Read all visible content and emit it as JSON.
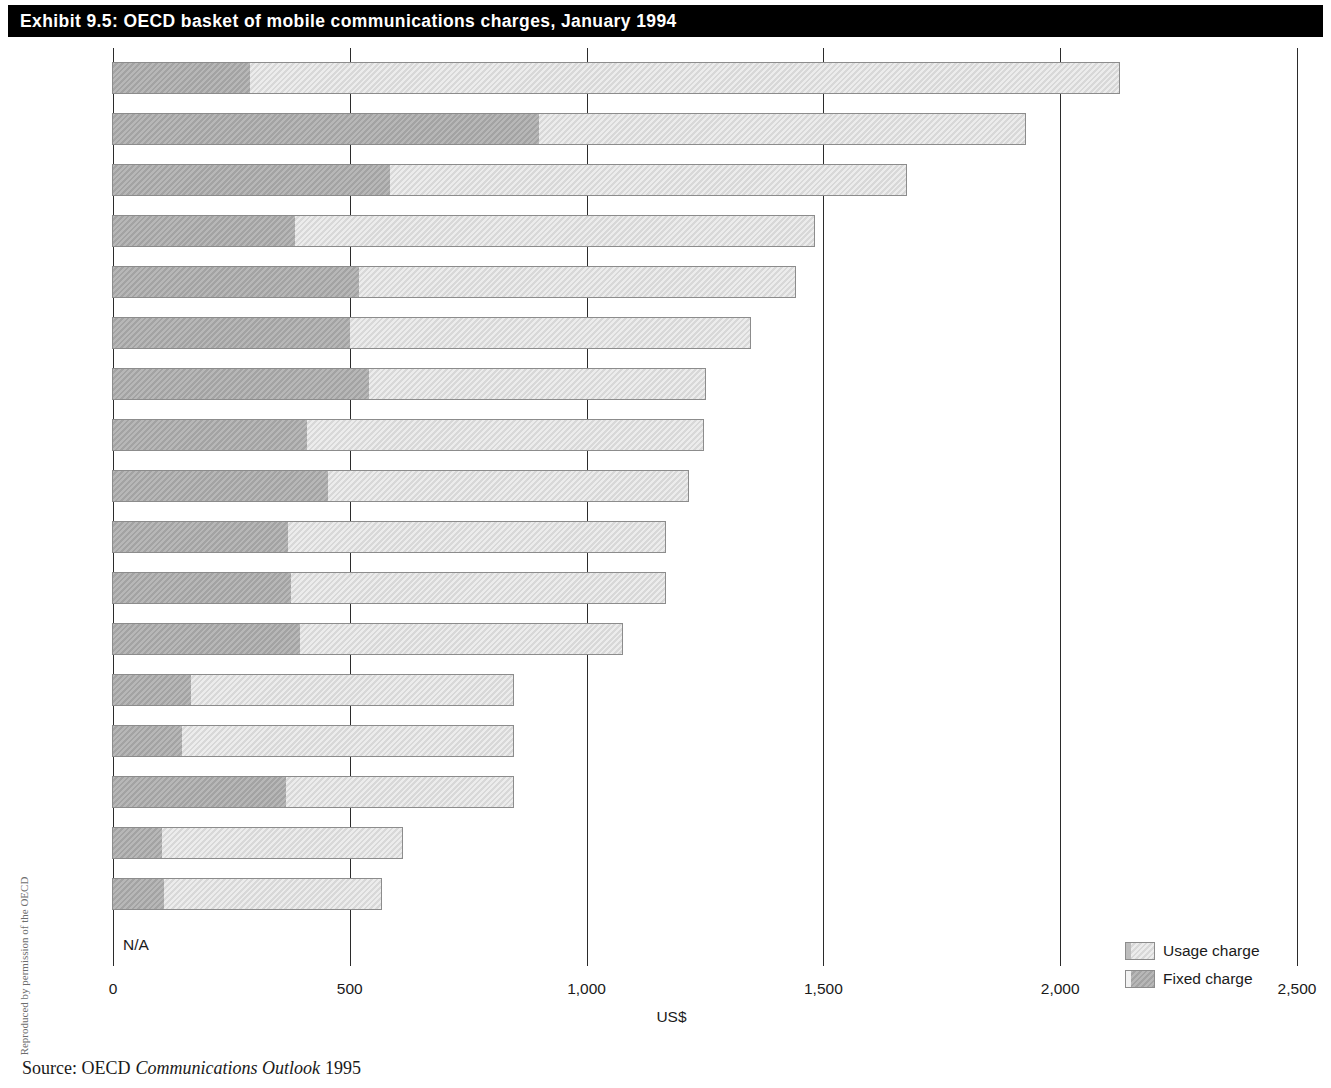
{
  "exhibit": {
    "title": "Exhibit 9.5:  OECD basket of mobile communications charges, January 1994"
  },
  "source": {
    "prefix": "Source: OECD",
    "publication": "Communications Outlook",
    "year": "1995"
  },
  "credit": {
    "text": "Reproduced by permission of the OECD"
  },
  "legend": {
    "position": "bottom-right",
    "items": [
      {
        "label": "Usage charge",
        "key": "usage",
        "color": "#dcdcdc",
        "icon": "usage-swatch"
      },
      {
        "label": "Fixed charge",
        "key": "fixed",
        "color": "#a3a3a3",
        "icon": "fixed-swatch"
      }
    ]
  },
  "chart_data": {
    "type": "bar",
    "orientation": "horizontal",
    "stacked": true,
    "title": "OECD basket of mobile communications charges, January 1994",
    "xlabel": "US$",
    "ylabel": "",
    "xlim": [
      0,
      2500
    ],
    "xticks": [
      0,
      500,
      1000,
      1500,
      2000,
      2500
    ],
    "xticklabels": [
      "0",
      "500",
      "1,000",
      "1,500",
      "2,000",
      "2,500"
    ],
    "grid": "vertical",
    "na_label": "N/A",
    "categories": [
      "Turkey",
      "France",
      "Portugal",
      "Germany",
      "Spain",
      "UK",
      "Luxembourg",
      "Netherlands",
      "Italy",
      "Austria",
      "Belgium",
      "Ireland",
      "Norway",
      "Sweden",
      "Switzerland",
      "Denmark",
      "Finland",
      "Greece"
    ],
    "series": [
      {
        "name": "Fixed charge",
        "key": "fixed",
        "color": "#a3a3a3",
        "values": [
          290,
          900,
          585,
          385,
          520,
          500,
          540,
          410,
          455,
          370,
          375,
          395,
          165,
          145,
          365,
          103,
          108,
          null
        ]
      },
      {
        "name": "Usage charge",
        "key": "usage",
        "color": "#dcdcdc",
        "values": [
          1835,
          1025,
          1090,
          1095,
          920,
          845,
          710,
          835,
          760,
          795,
          790,
          680,
          680,
          700,
          480,
          507,
          457,
          null
        ]
      }
    ],
    "totals": [
      2125,
      1925,
      1675,
      1480,
      1440,
      1345,
      1250,
      1245,
      1215,
      1165,
      1165,
      1075,
      845,
      845,
      845,
      610,
      565,
      null
    ]
  }
}
